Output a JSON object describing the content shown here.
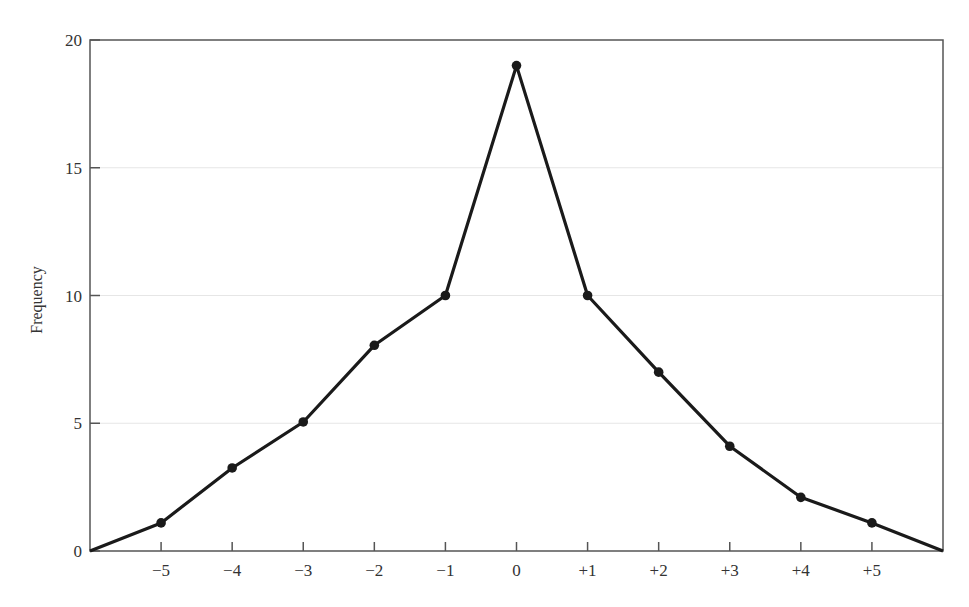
{
  "chart_data": {
    "type": "line",
    "title": "",
    "xlabel": "",
    "ylabel": "Frequency",
    "x": [
      -6,
      -5,
      -4,
      -3,
      -2,
      -1,
      0,
      1,
      2,
      3,
      4,
      5,
      6
    ],
    "series": [
      {
        "name": "Frequency",
        "values": [
          0,
          1.1,
          3.25,
          5.05,
          8.05,
          10,
          19,
          10,
          7,
          4.1,
          2.1,
          1.1,
          0
        ],
        "color": "#1a1a1a",
        "markers": true
      }
    ],
    "xticks": [
      -5,
      -4,
      -3,
      -2,
      -1,
      0,
      1,
      2,
      3,
      4,
      5
    ],
    "xtick_labels": [
      "−5",
      "−4",
      "−3",
      "−2",
      "−1",
      "0",
      "+1",
      "+2",
      "+3",
      "+4",
      "+5"
    ],
    "yticks": [
      0,
      5,
      10,
      15,
      20
    ],
    "ytick_labels": [
      "0",
      "5",
      "10",
      "15",
      "20"
    ],
    "xlim": [
      -6,
      6
    ],
    "ylim": [
      0,
      20
    ],
    "grid": "horizontal-faint",
    "legend": "none"
  }
}
